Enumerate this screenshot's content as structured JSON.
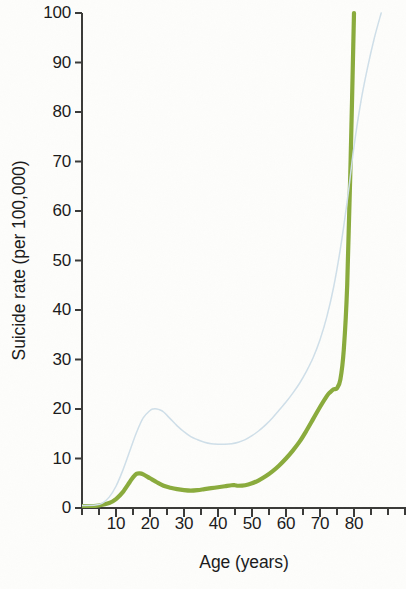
{
  "chart_data": {
    "type": "line",
    "title": "",
    "xlabel": "Age (years)",
    "ylabel": "Suicide rate (per 100,000)",
    "xlim": [
      0,
      95
    ],
    "ylim": [
      0,
      100
    ],
    "grid": false,
    "legend": "none",
    "x_major_ticks": [
      10,
      20,
      30,
      40,
      50,
      60,
      70,
      80
    ],
    "x_minor_tick_step": 5,
    "y_major_ticks": [
      0,
      10,
      20,
      30,
      40,
      50,
      60,
      70,
      80,
      90,
      100
    ],
    "x_tick_labels": [
      "10",
      "20",
      "30",
      "40",
      "50",
      "60",
      "70",
      "80"
    ],
    "y_tick_labels": [
      "0",
      "10",
      "20",
      "30",
      "40",
      "50",
      "60",
      "70",
      "80",
      "90",
      "100"
    ],
    "axis_color": "#3a3a38",
    "series": [
      {
        "name": "lower-curve",
        "color": "#8aab3c",
        "line_width": 4.2,
        "x": [
          0,
          3,
          5,
          8,
          10,
          12,
          14,
          15,
          16,
          17,
          18,
          20,
          22,
          24,
          26,
          28,
          30,
          32,
          34,
          36,
          38,
          40,
          42,
          44,
          45,
          46,
          48,
          50,
          52,
          54,
          56,
          58,
          60,
          62,
          64,
          66,
          68,
          70,
          72,
          73,
          74,
          75,
          76,
          77,
          78,
          79,
          80
        ],
        "values": [
          0.4,
          0.4,
          0.5,
          1.0,
          1.8,
          3.2,
          5.2,
          6.2,
          6.9,
          7.0,
          6.8,
          6.0,
          5.2,
          4.5,
          4.1,
          3.8,
          3.6,
          3.5,
          3.6,
          3.8,
          4.0,
          4.2,
          4.4,
          4.6,
          4.6,
          4.5,
          4.6,
          5.0,
          5.6,
          6.4,
          7.4,
          8.6,
          10.0,
          11.6,
          13.4,
          15.6,
          18.0,
          20.4,
          22.6,
          23.4,
          24.0,
          24.2,
          26.0,
          32.0,
          45.0,
          70.0,
          100.0
        ]
      },
      {
        "name": "upper-curve",
        "color": "#cfdfe9",
        "line_width": 1.5,
        "x": [
          0,
          4,
          6,
          8,
          10,
          12,
          14,
          16,
          18,
          20,
          21,
          22,
          23,
          24,
          26,
          28,
          30,
          32,
          34,
          36,
          38,
          40,
          42,
          44,
          46,
          48,
          50,
          52,
          54,
          56,
          58,
          60,
          62,
          64,
          66,
          68,
          70,
          72,
          74,
          76,
          78,
          80,
          82,
          84,
          86,
          88
        ],
        "values": [
          0.5,
          0.6,
          1.0,
          2.2,
          4.4,
          7.6,
          11.4,
          15.2,
          18.2,
          19.7,
          20.0,
          20.0,
          19.8,
          19.4,
          18.0,
          16.6,
          15.4,
          14.4,
          13.8,
          13.3,
          13.0,
          12.9,
          12.9,
          13.0,
          13.3,
          13.8,
          14.6,
          15.6,
          16.8,
          18.2,
          19.8,
          21.4,
          23.2,
          25.2,
          27.6,
          30.4,
          34.0,
          38.6,
          44.6,
          52.4,
          62.0,
          73.0,
          82.0,
          89.0,
          95.0,
          100.0
        ]
      }
    ]
  }
}
